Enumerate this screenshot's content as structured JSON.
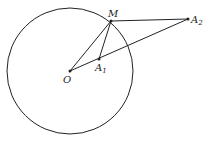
{
  "diagram": {
    "type": "geometry",
    "circle": {
      "center": "O",
      "cx": 70,
      "cy": 71,
      "r": 63
    },
    "points": {
      "O": {
        "label": "O",
        "x": 70,
        "y": 71
      },
      "M": {
        "label": "M",
        "x": 111,
        "y": 21
      },
      "A1": {
        "label": "A",
        "sub": "1",
        "x": 99,
        "y": 59
      },
      "A2": {
        "label": "A",
        "sub": "2",
        "x": 188,
        "y": 19
      }
    },
    "segments": [
      [
        "O",
        "M"
      ],
      [
        "M",
        "A1"
      ],
      [
        "M",
        "A2"
      ],
      [
        "O",
        "A2"
      ]
    ],
    "colors": {
      "stroke": "#222222",
      "background": "#ffffff"
    }
  }
}
